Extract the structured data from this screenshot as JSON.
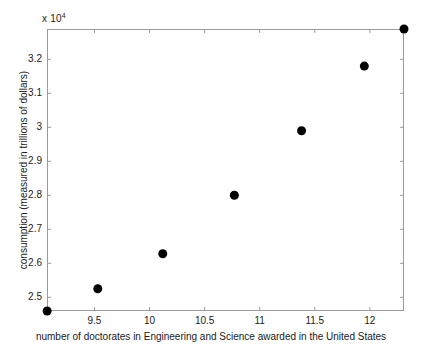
{
  "chart_data": {
    "type": "scatter",
    "title": "",
    "xlabel": "number of doctorates in Engineering and Science awarded in the United States",
    "ylabel": "consumption (measured in trillions of dollars)",
    "y_exponent_label": "x 10",
    "y_exponent_power": "4",
    "y_scale_factor": 10000,
    "xlim": [
      9.069,
      12.31
    ],
    "ylim": [
      2.4597,
      3.2891
    ],
    "ylim_scaled": [
      24597,
      32891
    ],
    "grid": false,
    "legend": null,
    "xticks": [
      9.5,
      10,
      10.5,
      11,
      11.5,
      12
    ],
    "xtick_labels": [
      "9.5",
      "10",
      "10.5",
      "11",
      "11.5",
      "12"
    ],
    "yticks": [
      2.5,
      2.6,
      2.7,
      2.8,
      2.9,
      3.0,
      3.1,
      3.2
    ],
    "ytick_labels": [
      "2.5",
      "2.6",
      "2.7",
      "2.8",
      "2.9",
      "3",
      "3.1",
      "3.2"
    ],
    "marker": "filled-circle",
    "marker_color": "#000000",
    "marker_size_px": 9,
    "axis_color": "#9a9a9a",
    "background_color": "#ffffff",
    "points": [
      {
        "x": 9.07,
        "y": 2.4597,
        "y_scaled": 24597
      },
      {
        "x": 9.53,
        "y": 2.525,
        "y_scaled": 25250
      },
      {
        "x": 10.12,
        "y": 2.628,
        "y_scaled": 26280
      },
      {
        "x": 10.77,
        "y": 2.8,
        "y_scaled": 28000
      },
      {
        "x": 11.38,
        "y": 2.99,
        "y_scaled": 29900
      },
      {
        "x": 11.95,
        "y": 3.18,
        "y_scaled": 31800
      },
      {
        "x": 12.31,
        "y": 3.2891,
        "y_scaled": 32891
      }
    ],
    "x": [
      9.07,
      9.53,
      10.12,
      10.77,
      11.38,
      11.95,
      12.31
    ],
    "values": [
      24597,
      25250,
      26280,
      28000,
      29900,
      31800,
      32891
    ]
  }
}
